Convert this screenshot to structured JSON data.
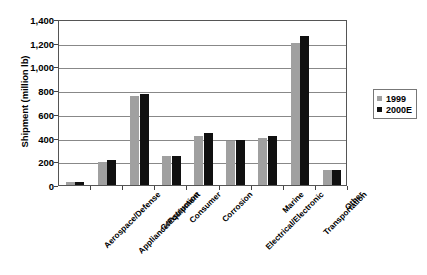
{
  "chart_data": {
    "type": "bar",
    "title": "",
    "xlabel": "",
    "ylabel": "Shipment (million lb)",
    "ylim": [
      0,
      1400
    ],
    "ytick_labels": [
      "0",
      "200",
      "400",
      "600",
      "800",
      "1,000",
      "1,200",
      "1,400"
    ],
    "ytick_values": [
      0,
      200,
      400,
      600,
      800,
      1000,
      1200,
      1400
    ],
    "grid": true,
    "legend_position": "right",
    "categories": [
      "Aerospace/Defense",
      "Appliance/Equipment",
      "Construction",
      "Consumer",
      "Corrosion",
      "Electrical/Electronic",
      "Marine",
      "Transportation",
      "Other"
    ],
    "series": [
      {
        "name": "1999",
        "color": "#a0a0a0",
        "values": [
          22,
          200,
          760,
          250,
          420,
          375,
          405,
          1215,
          125
        ]
      },
      {
        "name": "2000E",
        "color": "#101010",
        "values": [
          22,
          210,
          780,
          245,
          440,
          385,
          415,
          1275,
          125
        ]
      }
    ]
  },
  "legend": {
    "entries": [
      {
        "label": "1999"
      },
      {
        "label": "2000E"
      }
    ]
  }
}
